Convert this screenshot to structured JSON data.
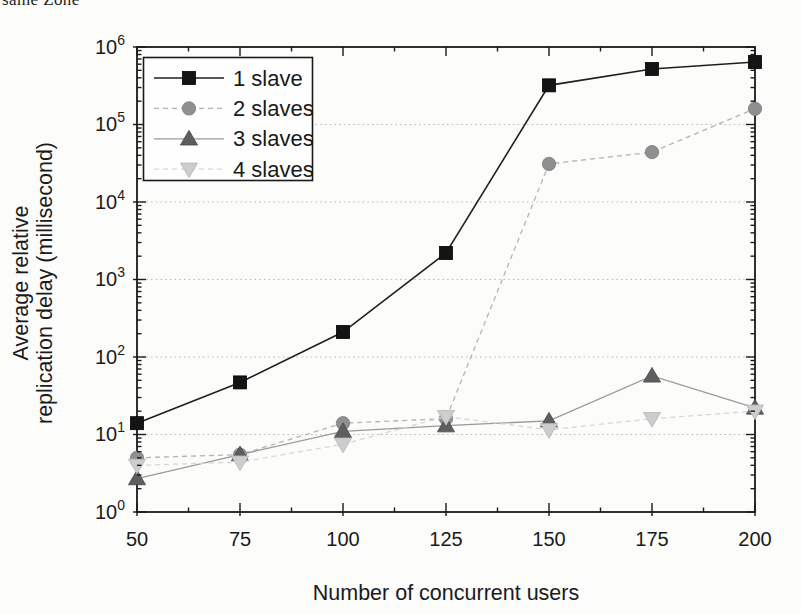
{
  "caption_fragment": "same Zone",
  "colors": {
    "background": "#fcfcfb",
    "axis": "#1a1a1a",
    "grid": "#b8b8b8",
    "legend_border": "#1a1a1a",
    "legend_fill": "#fefefe",
    "text": "#1a1a1a"
  },
  "chart_data": {
    "type": "line",
    "title": "",
    "xlabel": "Number of concurrent users",
    "ylabel": "Average relative replication delay (millisecond)",
    "ylabel_lines": [
      "Average relative",
      "replication delay (millisecond)"
    ],
    "x": [
      50,
      75,
      100,
      125,
      150,
      175,
      200
    ],
    "xlim": [
      50,
      200
    ],
    "x_major_ticks": [
      50,
      75,
      100,
      125,
      150,
      175,
      200
    ],
    "x_minor_step": 12.5,
    "ylim": [
      1,
      1000000
    ],
    "y_scale": "log",
    "y_major_tick_exponents": [
      0,
      1,
      2,
      3,
      4,
      5,
      6
    ],
    "grid": "horizontal dotted at each decade",
    "legend_position": "upper-left",
    "series": [
      {
        "name": "1 slave",
        "marker": "square",
        "line_style": "solid",
        "line_color": "#1f1f1f",
        "marker_color": "#141414",
        "marker_edge": "#000000",
        "values": [
          14,
          47,
          210,
          2200,
          320000,
          520000,
          640000
        ]
      },
      {
        "name": "2 slaves",
        "marker": "circle",
        "line_style": "dashed",
        "line_color": "#b3b3b3",
        "marker_color": "#8f8f8f",
        "marker_edge": "#7c7c7c",
        "values": [
          5,
          5.5,
          14,
          16,
          31000,
          44000,
          160000
        ]
      },
      {
        "name": "3 slaves",
        "marker": "triangle-up",
        "line_style": "solid",
        "line_color": "#9a9a9a",
        "marker_color": "#5e5e5e",
        "marker_edge": "#4a4a4a",
        "values": [
          2.7,
          5.5,
          11,
          13,
          15,
          57,
          22
        ]
      },
      {
        "name": "4 slaves",
        "marker": "triangle-down",
        "line_style": "dashed",
        "line_color": "#d6d6d6",
        "marker_color": "#cdcdcd",
        "marker_edge": "#b5b5b5",
        "values": [
          4,
          4.4,
          7.5,
          17,
          11.5,
          16,
          20
        ]
      }
    ]
  }
}
